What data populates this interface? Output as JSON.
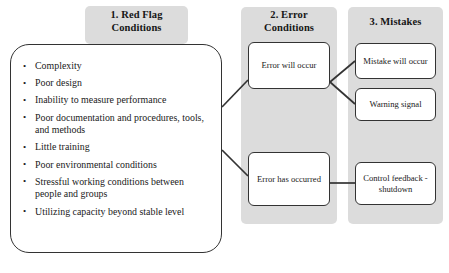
{
  "diagram": {
    "colors": {
      "panel_gray": "#dcdcdc",
      "box_border": "#333333",
      "box_fill": "#ffffff",
      "text": "#1a1a1a",
      "page_background": "#ffffff"
    }
  },
  "columns": [
    {
      "id": "red-flag-conditions",
      "heading": "1. Red Flag\nConditions",
      "heading_line1": "1. Red Flag",
      "heading_line2": "Conditions"
    },
    {
      "id": "error-conditions",
      "heading": "2. Error\nConditions",
      "heading_line1": "2. Error",
      "heading_line2": "Conditions"
    },
    {
      "id": "mistakes",
      "heading": "3. Mistakes",
      "heading_line1": "3. Mistakes",
      "heading_line2": ""
    }
  ],
  "red_flag_box": {
    "items": [
      "Complexity",
      "Poor design",
      "Inability to measure performance",
      "Poor documentation and procedures, tools, and methods",
      "Little training",
      "Poor environmental conditions",
      "Stressful working conditions between people and groups",
      "Utilizing capacity beyond stable level"
    ]
  },
  "error_nodes": [
    {
      "id": "error-will-occur",
      "label": "Error will occur"
    },
    {
      "id": "error-has-occurred",
      "label": "Error has occurred"
    }
  ],
  "mistake_nodes": [
    {
      "id": "mistake-will-occur",
      "label": "Mistake will occur"
    },
    {
      "id": "warning-signal",
      "label": "Warning signal"
    },
    {
      "id": "control-feedback-shutdown",
      "label": "Control feedback -shutdown"
    }
  ],
  "connectors": [
    {
      "id": "redflag-to-error-will",
      "from": "red-flag-box",
      "to": "error-will-occur"
    },
    {
      "id": "redflag-to-error-has",
      "from": "red-flag-box",
      "to": "error-has-occurred"
    },
    {
      "id": "error-will-to-mistake-will",
      "from": "error-will-occur",
      "to": "mistake-will-occur"
    },
    {
      "id": "error-will-to-warning",
      "from": "error-will-occur",
      "to": "warning-signal"
    },
    {
      "id": "error-has-to-control",
      "from": "error-has-occurred",
      "to": "control-feedback-shutdown"
    }
  ]
}
